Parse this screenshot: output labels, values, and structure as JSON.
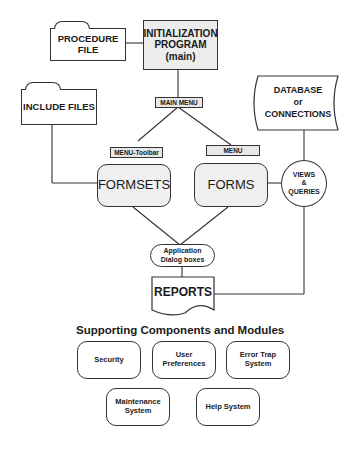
{
  "nodes": {
    "procedure_file": "PROCEDURE FILE",
    "init_line1": "INITIALIZATION",
    "init_line2": "PROGRAM",
    "init_line3": "(main)",
    "include_files": "INCLUDE FILES",
    "main_menu": "MAIN MENU",
    "menu_toolbar": "MENU-Toolbar",
    "menu": "MENU",
    "formsets": "FORMSETS",
    "forms": "FORMS",
    "database_line1": "DATABASE",
    "database_line2": "or",
    "database_line3": "CONNECTIONS",
    "views_line1": "VIEWS",
    "views_line2": "&",
    "views_line3": "QUERIES",
    "dialog_line1": "Application",
    "dialog_line2": "Dialog boxes",
    "reports": "REPORTS"
  },
  "supporting": {
    "heading": "Supporting Components and Modules",
    "items": [
      {
        "line1": "Security",
        "line2": ""
      },
      {
        "line1": "User",
        "line2": "Preferences"
      },
      {
        "line1": "Error Trap",
        "line2": "System"
      },
      {
        "line1": "Maintenance",
        "line2": "System"
      },
      {
        "line1": "Help System",
        "line2": ""
      }
    ]
  }
}
